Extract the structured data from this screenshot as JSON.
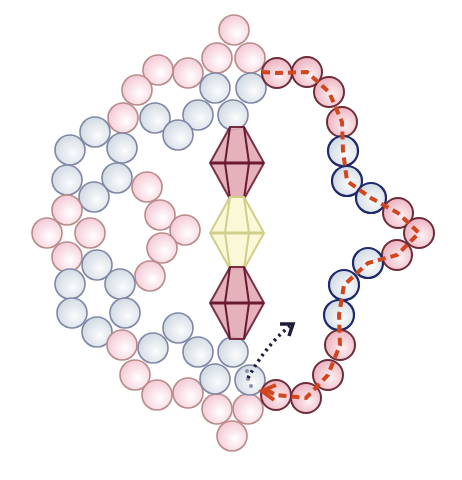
{
  "colors": {
    "background": "#ffffff",
    "pink_fill": "#f6d3dc",
    "pink_stroke": "#b98a8a",
    "blue_fill": "#dde4ea",
    "blue_stroke": "#7f86a6",
    "highlight_pink_stroke": "#6e2b38",
    "highlight_blue_stroke": "#1f2a6b",
    "bicone_pink_fill": "#e3a9b4",
    "bicone_pink_stroke": "#6a1b32",
    "bicone_yellow_fill": "#fbf8d8",
    "bicone_yellow_stroke": "#cfcf8a",
    "thread_path": "#d2461e",
    "direction_arrow": "#1d1d3a"
  },
  "bead_radius": 15,
  "beads": [
    {
      "x": 234,
      "y": 30,
      "type": "pink"
    },
    {
      "x": 217,
      "y": 58,
      "type": "pink"
    },
    {
      "x": 250,
      "y": 58,
      "type": "pink"
    },
    {
      "x": 188,
      "y": 73,
      "type": "pink"
    },
    {
      "x": 158,
      "y": 70,
      "type": "pink"
    },
    {
      "x": 137,
      "y": 90,
      "type": "pink"
    },
    {
      "x": 123,
      "y": 118,
      "type": "pink"
    },
    {
      "x": 215,
      "y": 88,
      "type": "blue"
    },
    {
      "x": 251,
      "y": 88,
      "type": "blue"
    },
    {
      "x": 198,
      "y": 115,
      "type": "blue"
    },
    {
      "x": 233,
      "y": 115,
      "type": "blue"
    },
    {
      "x": 155,
      "y": 118,
      "type": "blue"
    },
    {
      "x": 178,
      "y": 135,
      "type": "blue"
    },
    {
      "x": 95,
      "y": 132,
      "type": "blue"
    },
    {
      "x": 70,
      "y": 150,
      "type": "blue"
    },
    {
      "x": 122,
      "y": 148,
      "type": "blue"
    },
    {
      "x": 67,
      "y": 180,
      "type": "blue"
    },
    {
      "x": 117,
      "y": 178,
      "type": "blue"
    },
    {
      "x": 94,
      "y": 197,
      "type": "blue"
    },
    {
      "x": 147,
      "y": 187,
      "type": "pink"
    },
    {
      "x": 160,
      "y": 215,
      "type": "pink"
    },
    {
      "x": 185,
      "y": 230,
      "type": "pink"
    },
    {
      "x": 162,
      "y": 248,
      "type": "pink"
    },
    {
      "x": 150,
      "y": 276,
      "type": "pink"
    },
    {
      "x": 67,
      "y": 210,
      "type": "pink"
    },
    {
      "x": 47,
      "y": 233,
      "type": "pink"
    },
    {
      "x": 90,
      "y": 233,
      "type": "pink"
    },
    {
      "x": 67,
      "y": 257,
      "type": "pink"
    },
    {
      "x": 97,
      "y": 265,
      "type": "blue"
    },
    {
      "x": 70,
      "y": 284,
      "type": "blue"
    },
    {
      "x": 120,
      "y": 284,
      "type": "blue"
    },
    {
      "x": 72,
      "y": 313,
      "type": "blue"
    },
    {
      "x": 125,
      "y": 313,
      "type": "blue"
    },
    {
      "x": 97,
      "y": 332,
      "type": "blue"
    },
    {
      "x": 122,
      "y": 345,
      "type": "pink"
    },
    {
      "x": 135,
      "y": 375,
      "type": "pink"
    },
    {
      "x": 157,
      "y": 395,
      "type": "pink"
    },
    {
      "x": 188,
      "y": 393,
      "type": "pink"
    },
    {
      "x": 217,
      "y": 409,
      "type": "pink"
    },
    {
      "x": 248,
      "y": 409,
      "type": "pink"
    },
    {
      "x": 232,
      "y": 436,
      "type": "pink"
    },
    {
      "x": 153,
      "y": 348,
      "type": "blue"
    },
    {
      "x": 178,
      "y": 328,
      "type": "blue"
    },
    {
      "x": 198,
      "y": 352,
      "type": "blue"
    },
    {
      "x": 233,
      "y": 352,
      "type": "blue"
    },
    {
      "x": 215,
      "y": 379,
      "type": "blue"
    },
    {
      "x": 250,
      "y": 380,
      "type": "blue-start"
    },
    {
      "x": 277,
      "y": 73,
      "type": "pink-hl"
    },
    {
      "x": 307,
      "y": 72,
      "type": "pink-hl"
    },
    {
      "x": 329,
      "y": 92,
      "type": "pink-hl"
    },
    {
      "x": 342,
      "y": 122,
      "type": "pink-hl"
    },
    {
      "x": 343,
      "y": 151,
      "type": "blue-hl"
    },
    {
      "x": 347,
      "y": 181,
      "type": "blue-hl"
    },
    {
      "x": 371,
      "y": 198,
      "type": "blue-hl"
    },
    {
      "x": 398,
      "y": 213,
      "type": "pink-hl"
    },
    {
      "x": 419,
      "y": 233,
      "type": "pink-hl"
    },
    {
      "x": 397,
      "y": 255,
      "type": "pink-hl"
    },
    {
      "x": 368,
      "y": 263,
      "type": "blue-hl"
    },
    {
      "x": 344,
      "y": 285,
      "type": "blue-hl"
    },
    {
      "x": 339,
      "y": 315,
      "type": "blue-hl"
    },
    {
      "x": 340,
      "y": 345,
      "type": "pink-hl"
    },
    {
      "x": 328,
      "y": 375,
      "type": "pink-hl"
    },
    {
      "x": 306,
      "y": 398,
      "type": "pink-hl"
    },
    {
      "x": 276,
      "y": 395,
      "type": "pink-hl"
    }
  ],
  "bicones": [
    {
      "cx": 237,
      "cy": 163,
      "type": "pink"
    },
    {
      "cx": 237,
      "cy": 233,
      "type": "yellow"
    },
    {
      "cx": 237,
      "cy": 303,
      "type": "pink"
    }
  ],
  "thread_path_points": "262,72 277,73 307,72 329,92 342,122 343,151 347,181 371,198 398,213 419,233 397,255 368,263 344,285 339,315 340,345 328,375 306,398 276,395 262,388",
  "start_arrow": {
    "path": "M248,378 C258,360 272,340 290,326",
    "head": "M280,324 L293,324 L289,336"
  }
}
